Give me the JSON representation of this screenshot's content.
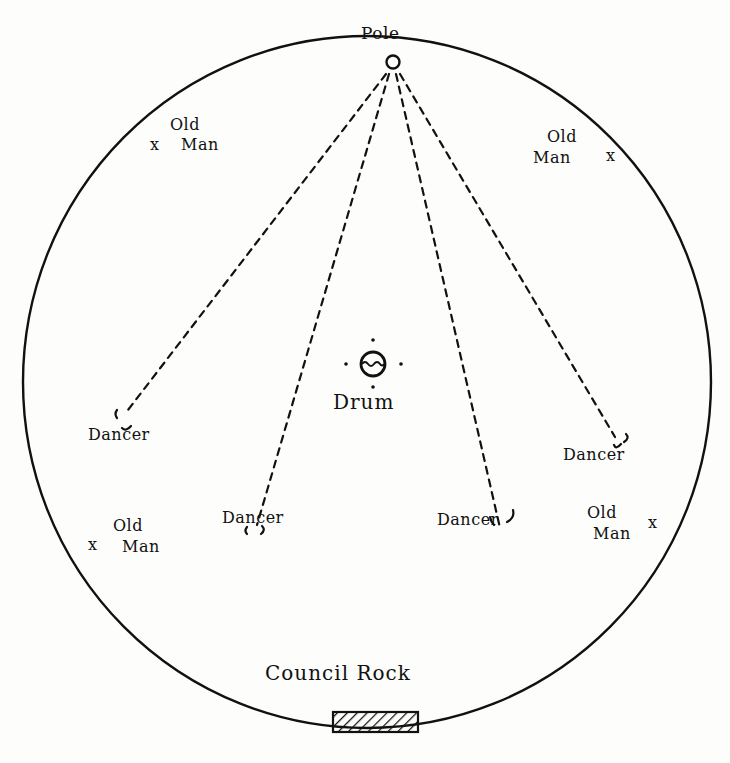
{
  "diagram": {
    "type": "dance-ground-layout",
    "labels": {
      "pole": "Pole",
      "drum": "Drum",
      "council_rock": "Council Rock",
      "dancer": "Dancer",
      "old_man_line1": "Old",
      "old_man_line2": "Man"
    },
    "markers": {
      "old_man_symbol": "x"
    },
    "dancers": [
      {
        "label": "Dancer",
        "position": "left"
      },
      {
        "label": "Dancer",
        "position": "center-left"
      },
      {
        "label": "Dancer",
        "position": "center-right"
      },
      {
        "label": "Dancer",
        "position": "right"
      }
    ],
    "old_men": [
      {
        "line1": "Old",
        "line2": "Man",
        "position": "upper-left"
      },
      {
        "line1": "Old",
        "line2": "Man",
        "position": "upper-right"
      },
      {
        "line1": "Old",
        "line2": "Man",
        "position": "lower-left"
      },
      {
        "line1": "Old",
        "line2": "Man",
        "position": "lower-right"
      }
    ],
    "colors": {
      "ink": "#111111",
      "paper": "#fdfdfb"
    }
  }
}
